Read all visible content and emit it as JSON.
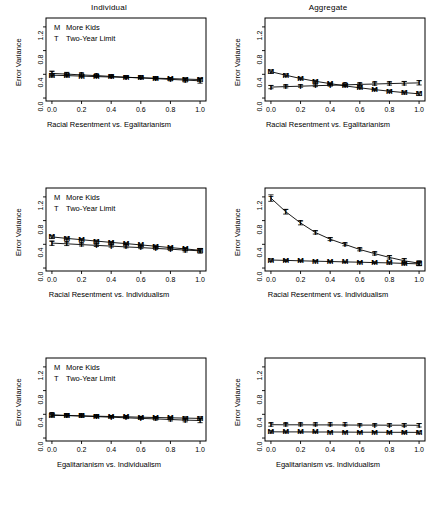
{
  "figure": {
    "columns": [
      "Individual",
      "Aggregate"
    ],
    "legend": {
      "items": [
        {
          "symbol": "M",
          "label": "More Kids"
        },
        {
          "symbol": "T",
          "label": "Two-Year Limit"
        }
      ]
    },
    "axis": {
      "ylabel": "Error Variance",
      "yticks": [
        "0.0",
        "0.4",
        "0.8",
        "1.2"
      ],
      "ytick_values": [
        0.0,
        0.4,
        0.8,
        1.2
      ],
      "xticks": [
        "0.0",
        "0.2",
        "0.4",
        "0.6",
        "0.8",
        "1.0"
      ],
      "xtick_values": [
        0.0,
        0.2,
        0.4,
        0.6,
        0.8,
        1.0
      ],
      "ylim": [
        -0.05,
        1.35
      ],
      "xlim": [
        -0.04,
        1.04
      ]
    }
  },
  "chart_data": [
    {
      "type": "line",
      "panel": "row1-left",
      "title": "Individual",
      "xlabel": "Racial Resentment vs. Egalitarianism",
      "ylabel": "Error Variance",
      "x": [
        0.0,
        0.1,
        0.2,
        0.3,
        0.4,
        0.5,
        0.6,
        0.7,
        0.8,
        0.9,
        1.0
      ],
      "xlim": [
        -0.04,
        1.04
      ],
      "ylim": [
        -0.05,
        1.35
      ],
      "grid": false,
      "legend_position": "top-left",
      "series": [
        {
          "name": "More Kids",
          "symbol": "M",
          "values": [
            0.385,
            0.378,
            0.37,
            0.362,
            0.355,
            0.348,
            0.342,
            0.335,
            0.328,
            0.32,
            0.312
          ],
          "err": [
            0.03,
            0.022,
            0.018,
            0.016,
            0.014,
            0.013,
            0.014,
            0.016,
            0.018,
            0.022,
            0.028
          ]
        },
        {
          "name": "Two-Year Limit",
          "symbol": "T",
          "values": [
            0.415,
            0.403,
            0.39,
            0.378,
            0.365,
            0.352,
            0.34,
            0.327,
            0.315,
            0.302,
            0.29
          ],
          "err": [
            0.04,
            0.03,
            0.023,
            0.019,
            0.016,
            0.015,
            0.016,
            0.019,
            0.024,
            0.031,
            0.04
          ]
        }
      ]
    },
    {
      "type": "line",
      "panel": "row1-right",
      "title": "Aggregate",
      "xlabel": "Racial Resentment vs. Egalitarianism",
      "ylabel": "Error Variance",
      "x": [
        0.0,
        0.1,
        0.2,
        0.3,
        0.4,
        0.5,
        0.6,
        0.7,
        0.8,
        0.9,
        1.0
      ],
      "xlim": [
        -0.04,
        1.04
      ],
      "ylim": [
        -0.05,
        1.35
      ],
      "grid": false,
      "legend_position": "none",
      "series": [
        {
          "name": "More Kids",
          "symbol": "M",
          "values": [
            0.445,
            0.385,
            0.33,
            0.283,
            0.243,
            0.205,
            0.172,
            0.142,
            0.115,
            0.092,
            0.072
          ],
          "err": [
            0.03,
            0.024,
            0.02,
            0.017,
            0.015,
            0.014,
            0.015,
            0.017,
            0.02,
            0.024,
            0.03
          ]
        },
        {
          "name": "Two-Year Limit",
          "symbol": "T",
          "values": [
            0.185,
            0.193,
            0.2,
            0.208,
            0.215,
            0.222,
            0.23,
            0.237,
            0.243,
            0.25,
            0.256
          ],
          "err": [
            0.028,
            0.022,
            0.018,
            0.016,
            0.015,
            0.016,
            0.018,
            0.021,
            0.025,
            0.03,
            0.036
          ]
        }
      ]
    },
    {
      "type": "line",
      "panel": "row2-left",
      "title": "",
      "xlabel": "Racial Resentment vs. Individualism",
      "ylabel": "Error Variance",
      "x": [
        0.0,
        0.1,
        0.2,
        0.3,
        0.4,
        0.5,
        0.6,
        0.7,
        0.8,
        0.9,
        1.0
      ],
      "xlim": [
        -0.04,
        1.04
      ],
      "ylim": [
        -0.05,
        1.35
      ],
      "grid": false,
      "legend_position": "top-left",
      "series": [
        {
          "name": "More Kids",
          "symbol": "M",
          "values": [
            0.525,
            0.5,
            0.478,
            0.455,
            0.433,
            0.412,
            0.39,
            0.368,
            0.345,
            0.322,
            0.3
          ],
          "err": [
            0.028,
            0.022,
            0.018,
            0.016,
            0.015,
            0.014,
            0.015,
            0.017,
            0.02,
            0.024,
            0.03
          ]
        },
        {
          "name": "Two-Year Limit",
          "symbol": "T",
          "values": [
            0.42,
            0.408,
            0.395,
            0.382,
            0.37,
            0.357,
            0.344,
            0.331,
            0.318,
            0.303,
            0.29
          ],
          "err": [
            0.038,
            0.029,
            0.023,
            0.019,
            0.017,
            0.016,
            0.017,
            0.02,
            0.024,
            0.031,
            0.04
          ]
        }
      ]
    },
    {
      "type": "line",
      "panel": "row2-right",
      "title": "",
      "xlabel": "Racial Resentment vs. Individualism",
      "ylabel": "Error Variance",
      "x": [
        0.0,
        0.1,
        0.2,
        0.3,
        0.4,
        0.5,
        0.6,
        0.7,
        0.8,
        0.9,
        1.0
      ],
      "xlim": [
        -0.05,
        1.35
      ],
      "ylim": [
        -0.05,
        1.35
      ],
      "grid": false,
      "legend_position": "none",
      "series": [
        {
          "name": "More Kids",
          "symbol": "M",
          "values": [
            0.135,
            0.128,
            0.122,
            0.116,
            0.11,
            0.104,
            0.098,
            0.092,
            0.086,
            0.078,
            0.07
          ],
          "err": [
            0.022,
            0.018,
            0.015,
            0.013,
            0.012,
            0.012,
            0.013,
            0.015,
            0.018,
            0.022,
            0.028
          ]
        },
        {
          "name": "Two-Year Limit",
          "symbol": "T",
          "values": [
            1.18,
            0.95,
            0.76,
            0.6,
            0.487,
            0.398,
            0.312,
            0.243,
            0.18,
            0.122,
            0.082
          ],
          "err": [
            0.055,
            0.04,
            0.032,
            0.027,
            0.024,
            0.022,
            0.022,
            0.024,
            0.028,
            0.034,
            0.042
          ]
        }
      ]
    },
    {
      "type": "line",
      "panel": "row3-left",
      "title": "",
      "xlabel": "Egalitarianism vs. Individualism",
      "ylabel": "Error Variance",
      "x": [
        0.0,
        0.1,
        0.2,
        0.3,
        0.4,
        0.5,
        0.6,
        0.7,
        0.8,
        0.9,
        1.0
      ],
      "xlim": [
        -0.04,
        1.04
      ],
      "ylim": [
        -0.05,
        1.35
      ],
      "grid": false,
      "legend_position": "top-left",
      "series": [
        {
          "name": "More Kids",
          "symbol": "M",
          "values": [
            0.382,
            0.378,
            0.373,
            0.368,
            0.363,
            0.358,
            0.352,
            0.347,
            0.342,
            0.337,
            0.332
          ],
          "err": [
            0.026,
            0.02,
            0.017,
            0.015,
            0.014,
            0.013,
            0.014,
            0.015,
            0.018,
            0.022,
            0.027
          ]
        },
        {
          "name": "Two-Year Limit",
          "symbol": "T",
          "values": [
            0.392,
            0.382,
            0.372,
            0.362,
            0.352,
            0.342,
            0.332,
            0.322,
            0.312,
            0.302,
            0.295
          ],
          "err": [
            0.034,
            0.026,
            0.021,
            0.018,
            0.016,
            0.015,
            0.016,
            0.019,
            0.023,
            0.029,
            0.036
          ]
        }
      ]
    },
    {
      "type": "line",
      "panel": "row3-right",
      "title": "",
      "xlabel": "Egalitarianism vs. Individualism",
      "ylabel": "Error Variance",
      "x": [
        0.0,
        0.1,
        0.2,
        0.3,
        0.4,
        0.5,
        0.6,
        0.7,
        0.8,
        0.9,
        1.0
      ],
      "xlim": [
        -0.04,
        1.04
      ],
      "ylim": [
        -0.05,
        1.35
      ],
      "grid": false,
      "legend_position": "none",
      "series": [
        {
          "name": "More Kids",
          "symbol": "M",
          "values": [
            0.105,
            0.104,
            0.103,
            0.102,
            0.101,
            0.1,
            0.099,
            0.098,
            0.097,
            0.096,
            0.095
          ],
          "err": [
            0.02,
            0.016,
            0.014,
            0.013,
            0.012,
            0.012,
            0.012,
            0.013,
            0.015,
            0.018,
            0.022
          ]
        },
        {
          "name": "Two-Year Limit",
          "symbol": "T",
          "values": [
            0.225,
            0.224,
            0.223,
            0.222,
            0.221,
            0.22,
            0.219,
            0.218,
            0.217,
            0.216,
            0.215
          ],
          "err": [
            0.026,
            0.021,
            0.018,
            0.016,
            0.015,
            0.014,
            0.015,
            0.017,
            0.02,
            0.024,
            0.029
          ]
        }
      ]
    }
  ]
}
